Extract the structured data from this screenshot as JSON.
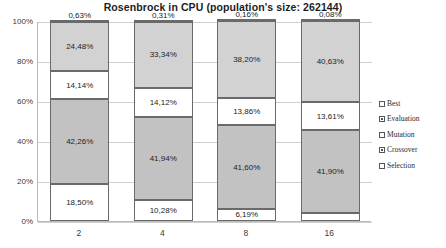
{
  "chart_data": {
    "type": "bar",
    "subtype": "stacked-percent",
    "title": "Rosenbrock in CPU (population's size: 262144)",
    "xlabel": "",
    "ylabel": "",
    "categories": [
      "2",
      "4",
      "8",
      "16"
    ],
    "ylim": [
      0,
      100
    ],
    "yticks": [
      "0%",
      "20%",
      "40%",
      "60%",
      "80%",
      "100%"
    ],
    "ytick_values": [
      0,
      20,
      40,
      60,
      80,
      100
    ],
    "grid": true,
    "legend_position": "right",
    "stack_order_bottom_to_top": [
      "Selection",
      "Crossover",
      "Mutation",
      "Evaluation",
      "Best"
    ],
    "series": [
      {
        "name": "Selection",
        "swatch": "outline",
        "color": "#ffffff",
        "values": [
          18.5,
          10.28,
          6.19,
          3.79
        ],
        "labels": [
          "18,50%",
          "10,28%",
          "6,19%",
          "3,79%"
        ]
      },
      {
        "name": "Crossover",
        "swatch": "filled",
        "color": "#c2c2c2",
        "values": [
          42.26,
          41.94,
          41.6,
          41.9
        ],
        "labels": [
          "42,26%",
          "41,94%",
          "41,60%",
          "41,90%"
        ]
      },
      {
        "name": "Mutation",
        "swatch": "outline",
        "color": "#ffffff",
        "values": [
          14.14,
          14.12,
          13.86,
          13.61
        ],
        "labels": [
          "14,14%",
          "14,12%",
          "13,86%",
          "13,61%"
        ]
      },
      {
        "name": "Evaluation",
        "swatch": "filled",
        "color": "#d2d2d2",
        "values": [
          24.48,
          33.34,
          38.2,
          40.63
        ],
        "labels": [
          "24,48%",
          "33,34%",
          "38,20%",
          "40,63%"
        ]
      },
      {
        "name": "Best",
        "swatch": "outline",
        "color": "#f2f2f2",
        "values": [
          0.63,
          0.31,
          0.16,
          0.08
        ],
        "labels": [
          "0,63%",
          "0,31%",
          "0,16%",
          "0,08%"
        ]
      }
    ]
  },
  "legend": {
    "items": [
      {
        "label": "Best",
        "swatch": "outline"
      },
      {
        "label": "Evaluation",
        "swatch": "filled"
      },
      {
        "label": "Mutation",
        "swatch": "outline"
      },
      {
        "label": "Crossover",
        "swatch": "filled"
      },
      {
        "label": "Selection",
        "swatch": "outline"
      }
    ]
  }
}
